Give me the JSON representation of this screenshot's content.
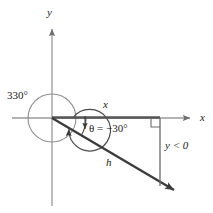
{
  "figure": {
    "type": "geometry-diagram",
    "canvas": {
      "width": 213,
      "height": 213,
      "background": "#ffffff"
    },
    "colors": {
      "axis": "#8c8c8c",
      "ray": "#3c3c3c",
      "segment": "#555555",
      "circle": "#8c8c8c",
      "text": "#1a1a1a"
    },
    "labels": {
      "rotation_angle": "330°",
      "axis_y": "y",
      "axis_x": "x",
      "side_adjacent": "x",
      "theta_equation": "θ = −30°",
      "hypotenuse": "h",
      "y_sign_condition": "y < 0"
    },
    "geometry": {
      "origin": {
        "x": 52,
        "y": 118
      },
      "circle_radius": 24,
      "terminal_ray_end": {
        "x": 180,
        "y": 194
      },
      "x_axis_arrow_end": {
        "x": 196,
        "y": 118
      },
      "y_axis_arrow_end": {
        "x": 52,
        "y": 26
      },
      "y_axis_bottom": {
        "x": 52,
        "y": 206
      },
      "vertical_drop_x": 160,
      "vertical_drop_bottom_y": 186,
      "angle_degrees": -30,
      "coterminal_degrees": 330
    }
  }
}
